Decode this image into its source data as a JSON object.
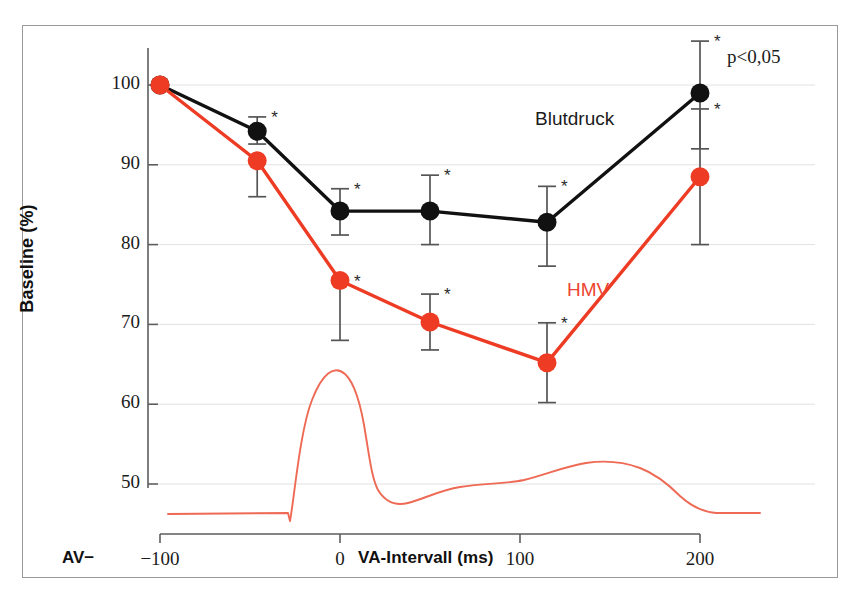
{
  "figure": {
    "background": "#ffffff",
    "border_color": "#9a9a9a"
  },
  "annotations": {
    "p_value": "p<0,05",
    "av_prefix": "AV−",
    "blutdruck_label": "Blutdruck",
    "hmv_label": "HMV",
    "significance_marker": "*"
  },
  "colors": {
    "blutdruck": "#111111",
    "hmv": "#EE3B24",
    "waveform": "#EE6A55",
    "gridline": "#e2e2e2",
    "axis": "#5d5d5d",
    "errorbar": "#555555"
  },
  "chart_data": {
    "type": "line",
    "title": "",
    "subtitle": "",
    "xlabel": "VA-Intervall (ms)",
    "ylabel": "Baseline (%)",
    "xlim": [
      -130,
      235
    ],
    "ylim": [
      43,
      105
    ],
    "xticks": [
      -100,
      0,
      100,
      200
    ],
    "xticklabels": [
      "−100",
      "0",
      "100",
      "200"
    ],
    "yticks": [
      50,
      60,
      70,
      80,
      90,
      100
    ],
    "yticklabels": [
      "50",
      "60",
      "70",
      "80",
      "90",
      "100"
    ],
    "grid": "horizontal",
    "legend_position": "inline-annotation",
    "x": [
      -100,
      -46,
      0,
      50,
      115,
      200
    ],
    "series": [
      {
        "name": "Blutdruck",
        "color": "#111111",
        "values": [
          100.0,
          94.2,
          84.2,
          84.2,
          82.8,
          99.0
        ],
        "err_low": [
          0.0,
          1.6,
          3.0,
          4.2,
          5.5,
          7.0
        ],
        "err_high": [
          0.0,
          1.8,
          2.8,
          4.5,
          4.5,
          6.5
        ],
        "significant": [
          false,
          true,
          true,
          true,
          true,
          true
        ]
      },
      {
        "name": "HMV",
        "color": "#EE3B24",
        "values": [
          100.0,
          90.5,
          75.5,
          70.3,
          65.2,
          88.5
        ],
        "err_low": [
          0.0,
          4.5,
          7.5,
          3.5,
          5.0,
          8.5
        ],
        "err_high": [
          0.0,
          0.0,
          0.0,
          3.5,
          5.0,
          8.5
        ],
        "significant": [
          false,
          false,
          true,
          true,
          true,
          true
        ]
      }
    ],
    "inset_waveform": {
      "name": "aortic-flow-trace",
      "color": "#EE6A55",
      "description": "flow/pressure waveform beneath the data curves"
    }
  }
}
